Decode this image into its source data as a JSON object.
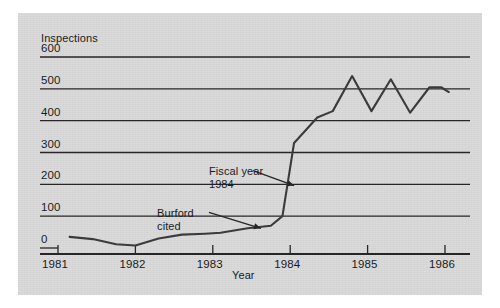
{
  "figure": {
    "panel_bg": "#d9d9d9",
    "page_bg": "#ffffff",
    "ink": "#262626"
  },
  "chart_data": {
    "type": "line",
    "title": "",
    "ylabel": "Inspections",
    "xlabel": "Year",
    "ylim": [
      0,
      600
    ],
    "xlim": [
      1981,
      1986.1
    ],
    "yticks": [
      0,
      100,
      200,
      300,
      400,
      500,
      600
    ],
    "ytick_labels": [
      "0",
      "100",
      "200",
      "300",
      "400",
      "500",
      "600"
    ],
    "xticks": [
      1981,
      1982,
      1983,
      1984,
      1985,
      1986
    ],
    "xtick_labels": [
      "1981",
      "1982",
      "1983",
      "1984",
      "1985",
      "1986"
    ],
    "grid": "horizontal",
    "legend": "none",
    "series": [
      {
        "name": "Inspections",
        "color": "#3b3b3b",
        "x": [
          1981.15,
          1981.45,
          1981.75,
          1982.0,
          1982.3,
          1982.6,
          1982.9,
          1983.1,
          1983.45,
          1983.75,
          1983.9,
          1984.05,
          1984.35,
          1984.55,
          1984.8,
          1985.05,
          1985.3,
          1985.55,
          1985.8,
          1985.95,
          1986.05
        ],
        "y": [
          35,
          28,
          12,
          8,
          30,
          42,
          45,
          48,
          62,
          70,
          100,
          330,
          410,
          430,
          540,
          430,
          530,
          425,
          505,
          505,
          490
        ]
      }
    ],
    "annotations": [
      {
        "name": "burford-cited",
        "text_lines": [
          "Burford",
          "cited"
        ],
        "text_x": 1982.55,
        "text_y": 120,
        "arrow_to_x": 1983.6,
        "arrow_to_y": 60
      },
      {
        "name": "fiscal-year-1984",
        "text_lines": [
          "Fiscal year",
          "1984"
        ],
        "text_x": 1983.25,
        "text_y": 250,
        "arrow_to_x": 1984.1,
        "arrow_to_y": 195
      }
    ]
  }
}
